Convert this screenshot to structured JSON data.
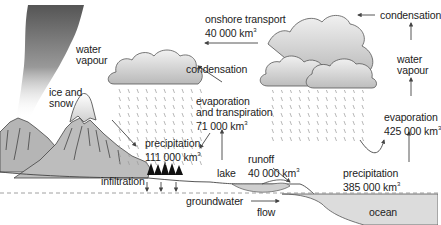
{
  "diagram": {
    "labels": {
      "water_vapour_left": {
        "line1": "water",
        "line2": "vapour"
      },
      "ice_and_snow": {
        "line1": "ice and",
        "line2": "snow"
      },
      "onshore_transport": {
        "line1": "onshore transport",
        "value": "40 000 km",
        "unit_sup": "3"
      },
      "condensation_left": {
        "text": "condensation"
      },
      "evaporation_transpiration": {
        "line1": "evaporation",
        "line2": "and transpiration",
        "value": "71 000 km",
        "unit_sup": "3"
      },
      "precipitation_land": {
        "line1": "precipitation",
        "value": "111 000 km",
        "unit_sup": "3"
      },
      "lake": {
        "text": "lake"
      },
      "runoff": {
        "line1": "runoff",
        "value": "40 000 km",
        "unit_sup": "3"
      },
      "infiltration": {
        "text": "infiltration"
      },
      "groundwater": {
        "text": "groundwater"
      },
      "flow": {
        "text": "flow"
      },
      "condensation_right": {
        "text": "condensation"
      },
      "water_vapour_right": {
        "line1": "water",
        "line2": "vapour"
      },
      "evaporation_ocean": {
        "line1": "evaporation",
        "value": "425 000 km",
        "unit_sup": "3"
      },
      "precipitation_ocean": {
        "line1": "precipitation",
        "value": "385 000 km",
        "unit_sup": "3"
      },
      "ocean": {
        "text": "ocean"
      }
    },
    "colors": {
      "cloud_fill": "#d4d4d4",
      "cloud_stroke": "#555555",
      "mountain_fill": "#bdbdbd",
      "ocean_fill": "#dcdcdc",
      "lake_fill": "#cfcfcf",
      "arrow": "#444444",
      "rain": "#9a9a9a",
      "text": "#222222"
    }
  }
}
